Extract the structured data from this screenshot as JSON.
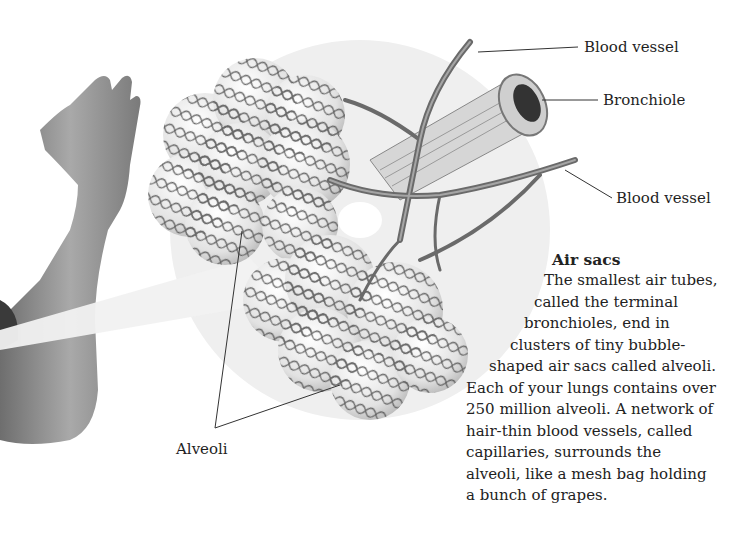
{
  "illustration": {
    "subject": "alveoli cluster with blood vessels and bronchiole",
    "background_circle_color": "#efefef",
    "mesh_color": "#5a5a5a",
    "skin_tone": "#8a8a8a"
  },
  "labels": {
    "blood_vessel_top": "Blood vessel",
    "bronchiole": "Bronchiole",
    "blood_vessel_bottom": "Blood vessel",
    "alveoli": "Alveoli"
  },
  "sidebar": {
    "title": "Air sacs",
    "lines": [
      "The smallest air tubes,",
      "called the terminal",
      "bronchioles, end in",
      "clusters of tiny bubble-",
      "shaped air sacs called alveoli.",
      "Each of your lungs contains over",
      "250 million alveoli. A network of",
      "hair-thin blood vessels, called",
      "capillaries, surrounds the",
      "alveoli, like a mesh bag holding",
      "a bunch of grapes."
    ]
  }
}
